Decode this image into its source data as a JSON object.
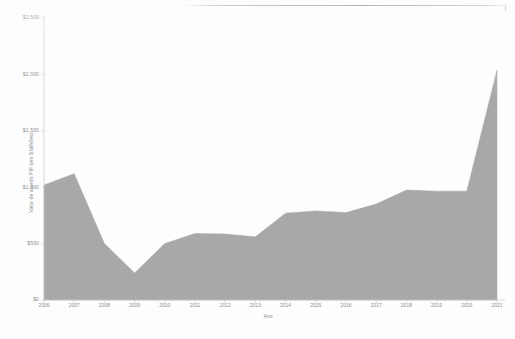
{
  "chart_data": {
    "type": "area",
    "title": "",
    "xlabel": "Ano",
    "ylabel": "Valor de acordo PIF (em $ bilhões)",
    "categories": [
      "2006",
      "2007",
      "2008",
      "2009",
      "2010",
      "2011",
      "2012",
      "2013",
      "2014",
      "2015",
      "2016",
      "2017",
      "2018",
      "2019",
      "2020",
      "2021"
    ],
    "values": [
      1020,
      1120,
      500,
      240,
      500,
      590,
      585,
      560,
      770,
      790,
      775,
      850,
      975,
      965,
      965,
      2040
    ],
    "series": [
      {
        "name": "Valor de acordo PIF",
        "values": [
          1020,
          1120,
          500,
          240,
          500,
          590,
          585,
          560,
          770,
          790,
          775,
          850,
          975,
          965,
          965,
          2040
        ]
      }
    ],
    "ylim": [
      0,
      2500
    ],
    "yticks": [
      0,
      500,
      1000,
      1500,
      2000,
      2500
    ],
    "ytick_labels": [
      "$0",
      "$500",
      "$1.000",
      "$1.500",
      "$2.000",
      "$2.500"
    ],
    "xtick_labels": [
      "2006",
      "2007",
      "2008",
      "2009",
      "2010",
      "2011",
      "2012",
      "2013",
      "2014",
      "2015",
      "2016",
      "2017",
      "2018",
      "2019",
      "2020",
      "2021"
    ],
    "grid": false,
    "legend": "none",
    "area_fill_color": "#a8a8a8",
    "axis_color": "#c9c9c9",
    "text_color": "#8d8d8d",
    "background_color": "#ffffff"
  },
  "plot": {
    "left": 44,
    "top": 18,
    "right": 497,
    "bottom": 300
  }
}
